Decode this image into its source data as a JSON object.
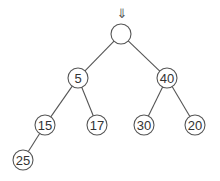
{
  "diagram": {
    "type": "binary-tree",
    "colors": {
      "stroke": "#555555",
      "text": "#333333",
      "background": "#ffffff"
    },
    "pointer": {
      "glyph": "⇓",
      "target": "root"
    },
    "nodes": [
      {
        "id": "root",
        "label": "",
        "x": 121,
        "y": 34,
        "r": 10
      },
      {
        "id": "n5",
        "label": "5",
        "x": 78,
        "y": 78,
        "r": 10
      },
      {
        "id": "n40",
        "label": "40",
        "x": 167,
        "y": 78,
        "r": 10
      },
      {
        "id": "n15",
        "label": "15",
        "x": 45,
        "y": 125,
        "r": 10
      },
      {
        "id": "n17",
        "label": "17",
        "x": 97,
        "y": 125,
        "r": 10
      },
      {
        "id": "n30",
        "label": "30",
        "x": 144,
        "y": 125,
        "r": 10
      },
      {
        "id": "n20",
        "label": "20",
        "x": 195,
        "y": 125,
        "r": 10
      },
      {
        "id": "n25",
        "label": "25",
        "x": 23,
        "y": 160,
        "r": 10
      }
    ],
    "edges": [
      {
        "from": "root",
        "to": "n5"
      },
      {
        "from": "root",
        "to": "n40"
      },
      {
        "from": "n5",
        "to": "n15"
      },
      {
        "from": "n5",
        "to": "n17"
      },
      {
        "from": "n40",
        "to": "n30"
      },
      {
        "from": "n40",
        "to": "n20"
      },
      {
        "from": "n15",
        "to": "n25"
      }
    ]
  }
}
